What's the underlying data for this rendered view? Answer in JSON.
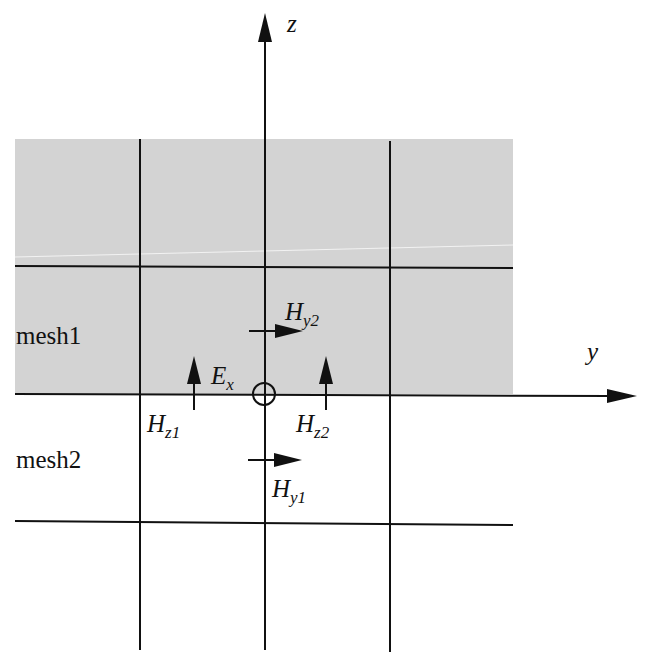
{
  "diagram": {
    "axes": {
      "z_label": "z",
      "y_label": "y"
    },
    "regions": [
      {
        "label": "mesh1",
        "fill": "#d3d3d3"
      },
      {
        "label": "mesh2",
        "fill": "#ffffff"
      }
    ],
    "fields": {
      "hy2": {
        "main": "H",
        "sub": "y2"
      },
      "ex": {
        "main": "E",
        "sub": "x"
      },
      "hz1": {
        "main": "H",
        "sub": "z1"
      },
      "hz2": {
        "main": "H",
        "sub": "z2"
      },
      "hy1": {
        "main": "H",
        "sub": "y1"
      }
    },
    "colors": {
      "grid_line": "#111111",
      "shaded_region": "#d3d3d3",
      "background": "#ffffff"
    }
  }
}
